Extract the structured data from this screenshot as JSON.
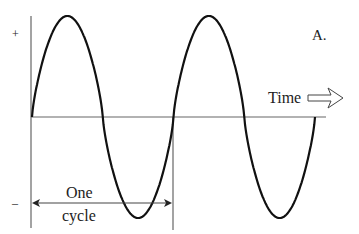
{
  "figure": {
    "panel_label": "A.",
    "plus_sign": "+",
    "minus_sign": "–",
    "time_label": "Time",
    "cycle_label_line1": "One",
    "cycle_label_line2": "cycle",
    "colors": {
      "curve": "#111111",
      "axis": "#555555",
      "text": "#222222",
      "background": "#ffffff"
    }
  },
  "chart_data": {
    "type": "line",
    "title": "",
    "xlabel": "Time",
    "ylabel": "",
    "y_markers": [
      "+",
      "–"
    ],
    "series": [
      {
        "name": "sine wave",
        "description": "Two complete cycles of a sinusoid starting at zero going positive"
      }
    ],
    "cycles_shown": 2,
    "annotation": "One cycle (bracket spanning first full period)",
    "grid": false
  }
}
